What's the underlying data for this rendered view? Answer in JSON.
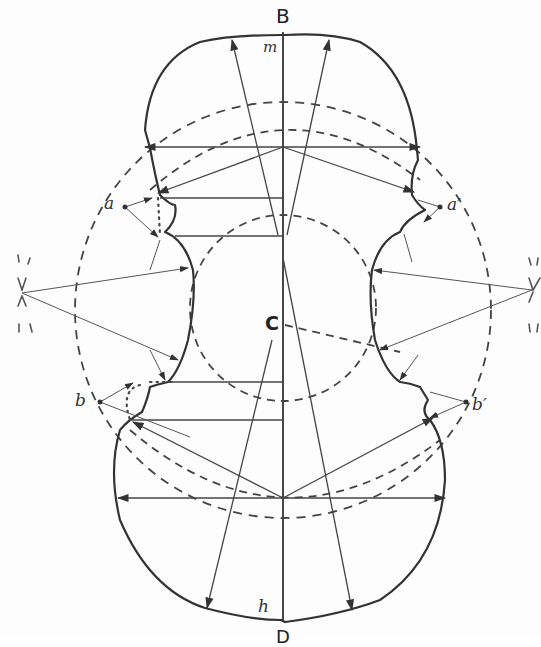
{
  "diagram": {
    "labels": {
      "top_axis": "B",
      "top_point": "m",
      "center": "C",
      "bottom_axis": "D",
      "bottom_point": "h",
      "upper_left_corner": "a",
      "upper_right_corner": "a′",
      "lower_left_corner": "b",
      "lower_right_corner": "b′"
    },
    "colors": {
      "ink": "#333333",
      "paper": "#fdfdfd"
    }
  }
}
